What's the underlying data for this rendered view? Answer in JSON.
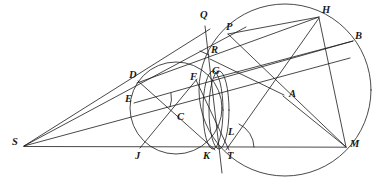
{
  "figure": {
    "width": 380,
    "height": 190,
    "background": "#ffffff",
    "stroke_color": "#1a1a1a",
    "stroke_width": 0.8,
    "label_color": "#1a1a1a"
  },
  "points": {
    "S": {
      "label": "S",
      "x": 24,
      "y": 146,
      "lx": 14,
      "ly": 141
    },
    "D": {
      "label": "D",
      "x": 139,
      "y": 82,
      "lx": 131,
      "ly": 73
    },
    "E": {
      "label": "E",
      "x": 136,
      "y": 102,
      "lx": 127,
      "ly": 98
    },
    "C": {
      "label": "C",
      "x": 174,
      "y": 117,
      "lx": 178,
      "ly": 114
    },
    "J": {
      "label": "J",
      "x": 141,
      "y": 147,
      "lx": 136,
      "ly": 150
    },
    "K": {
      "label": "K",
      "x": 212,
      "y": 147,
      "lx": 205,
      "ly": 150
    },
    "T": {
      "label": "T",
      "x": 228,
      "y": 147,
      "lx": 227,
      "ly": 150
    },
    "L": {
      "label": "L",
      "x": 225,
      "y": 136,
      "lx": 228,
      "ly": 131
    },
    "F": {
      "label": "F",
      "x": 196,
      "y": 81,
      "lx": 192,
      "ly": 76
    },
    "G": {
      "label": "G",
      "x": 215,
      "y": 76,
      "lx": 213,
      "ly": 71
    },
    "R": {
      "label": "R",
      "x": 211,
      "y": 57,
      "lx": 211,
      "ly": 50
    },
    "Q": {
      "label": "Q",
      "x": 205,
      "y": 24,
      "lx": 202,
      "ly": 14
    },
    "P": {
      "label": "P",
      "x": 228,
      "y": 35,
      "lx": 226,
      "ly": 26
    },
    "H": {
      "label": "H",
      "x": 318,
      "y": 18,
      "lx": 322,
      "ly": 9
    },
    "B": {
      "label": "B",
      "x": 352,
      "y": 42,
      "lx": 354,
      "ly": 36
    },
    "A": {
      "label": "A",
      "x": 283,
      "y": 95,
      "lx": 288,
      "ly": 93
    },
    "M": {
      "label": "M",
      "x": 345,
      "y": 147,
      "lx": 349,
      "ly": 143
    }
  },
  "circles": [
    {
      "name": "small-left-circle",
      "cx": 176,
      "cy": 108,
      "r": 46
    },
    {
      "name": "narrow-lens-left",
      "cx": 213,
      "cy": 110,
      "rx": 10,
      "ry": 39
    },
    {
      "name": "narrow-lens-right",
      "cx": 219,
      "cy": 110,
      "rx": 10,
      "ry": 39
    },
    {
      "name": "large-right-circle",
      "cx": 285,
      "cy": 90,
      "r": 86
    }
  ],
  "segments": [
    {
      "name": "baseline-S-M",
      "from": "S",
      "to": "M"
    },
    {
      "name": "line-S-D-Q",
      "x1": 24,
      "y1": 146,
      "x2": 208,
      "y2": 31
    },
    {
      "name": "line-S-E-R-P",
      "x1": 24,
      "y1": 146,
      "x2": 244,
      "y2": 28
    },
    {
      "name": "line-S-C-G-A",
      "x1": 24,
      "y1": 146,
      "x2": 345,
      "y2": 60
    },
    {
      "name": "line-S-J-K-T-M",
      "x1": 24,
      "y1": 146,
      "x2": 345,
      "y2": 147
    },
    {
      "name": "chord-D-F-G-H",
      "x1": 139,
      "y1": 82,
      "x2": 318,
      "y2": 18
    },
    {
      "name": "chord-D-C-K",
      "x1": 139,
      "y1": 82,
      "x2": 214,
      "y2": 148
    },
    {
      "name": "chord-E-C-A-B",
      "x1": 136,
      "y1": 102,
      "x2": 352,
      "y2": 42
    },
    {
      "name": "chord-F-C-J",
      "x1": 196,
      "y1": 81,
      "x2": 141,
      "y2": 147
    },
    {
      "name": "chord-F-L-T",
      "x1": 196,
      "y1": 81,
      "x2": 228,
      "y2": 148
    },
    {
      "name": "chord-Q-R-K",
      "x1": 205,
      "y1": 26,
      "x2": 222,
      "y2": 172
    },
    {
      "name": "chord-P-A-M",
      "x1": 228,
      "y1": 35,
      "x2": 345,
      "y2": 147
    },
    {
      "name": "chord-P-H-arc-top",
      "x1": 228,
      "y1": 35,
      "x2": 318,
      "y2": 18
    },
    {
      "name": "chord-H-L-T",
      "x1": 318,
      "y1": 18,
      "x2": 227,
      "y2": 148
    },
    {
      "name": "chord-H-M",
      "x1": 318,
      "y1": 18,
      "x2": 345,
      "y2": 147
    },
    {
      "name": "chord-R-A",
      "x1": 211,
      "y1": 59,
      "x2": 283,
      "y2": 95
    },
    {
      "name": "chord-G-B",
      "x1": 215,
      "y1": 77,
      "x2": 352,
      "y2": 42
    },
    {
      "name": "chord-A-M-short",
      "x1": 283,
      "y1": 95,
      "x2": 345,
      "y2": 147
    }
  ],
  "angle_marks": [
    {
      "name": "angle-arc-at-F",
      "cx": 196,
      "cy": 81,
      "r": 26,
      "a1": 118,
      "a2": 168
    },
    {
      "name": "angle-arc-at-T",
      "cx": 228,
      "cy": 147,
      "r": 26,
      "a1": 295,
      "a2": 360
    },
    {
      "name": "angle-tick-at-R",
      "x1": 200,
      "y1": 51,
      "x2": 209,
      "y2": 55
    }
  ],
  "labels_order": [
    "Q",
    "P",
    "H",
    "B",
    "R",
    "G",
    "D",
    "F",
    "A",
    "E",
    "C",
    "S",
    "J",
    "K",
    "T",
    "L",
    "M"
  ]
}
